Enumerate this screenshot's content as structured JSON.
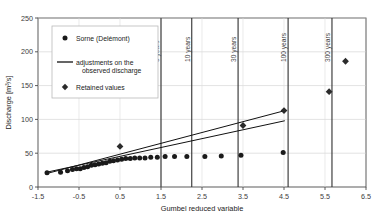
{
  "chart_data": {
    "type": "scatter",
    "title": "",
    "xlabel": "Gumbel reduced variable",
    "ylabel": "Discharge [m3/s]",
    "ylabel_display": "Discharge [m³/s]",
    "xlim": [
      -1.5,
      6.5
    ],
    "ylim": [
      0,
      250
    ],
    "xticks": [
      "-1.5",
      "-0.5",
      "0.5",
      "1.5",
      "2.5",
      "3.5",
      "4.5",
      "5.5",
      "6.5"
    ],
    "xtick_values": [
      -1.5,
      -0.5,
      0.5,
      1.5,
      2.5,
      3.5,
      4.5,
      5.5,
      6.5
    ],
    "yticks": [
      "0",
      "50",
      "100",
      "150",
      "200",
      "250"
    ],
    "ytick_values": [
      0,
      50,
      100,
      150,
      200,
      250
    ],
    "grid": true,
    "legend_position": "upper-left",
    "series": [
      {
        "name": "Sorne (Delemont)",
        "name_display": "Sorne (Delémont)",
        "type": "scatter",
        "marker": "circle",
        "color": "#1a1a1a",
        "points": [
          [
            -1.28,
            21
          ],
          [
            -0.95,
            22
          ],
          [
            -0.78,
            24
          ],
          [
            -0.66,
            26
          ],
          [
            -0.56,
            27
          ],
          [
            -0.47,
            27
          ],
          [
            -0.38,
            29
          ],
          [
            -0.29,
            30
          ],
          [
            -0.2,
            32
          ],
          [
            -0.11,
            33
          ],
          [
            -0.02,
            34
          ],
          [
            0.07,
            35
          ],
          [
            0.16,
            36
          ],
          [
            0.25,
            38
          ],
          [
            0.34,
            39
          ],
          [
            0.44,
            40
          ],
          [
            0.54,
            41
          ],
          [
            0.64,
            42
          ],
          [
            0.75,
            42
          ],
          [
            0.86,
            43
          ],
          [
            0.98,
            43
          ],
          [
            1.11,
            43
          ],
          [
            1.25,
            44
          ],
          [
            1.41,
            44
          ],
          [
            1.6,
            45
          ],
          [
            1.83,
            45
          ],
          [
            2.13,
            45
          ],
          [
            2.57,
            45
          ],
          [
            2.97,
            46
          ],
          [
            3.45,
            47
          ],
          [
            4.48,
            51
          ]
        ]
      },
      {
        "name": "adjustments on the observed discharge",
        "type": "line",
        "color": "#111111",
        "lines": [
          {
            "x": [
              -1.28,
              4.52
            ],
            "y": [
              20,
              113
            ]
          },
          {
            "x": [
              -1.28,
              4.52
            ],
            "y": [
              22,
              98
            ]
          }
        ]
      },
      {
        "name": "Retained values",
        "type": "scatter",
        "marker": "diamond",
        "color": "#2b2b2b",
        "points": [
          [
            0.5,
            60
          ],
          [
            3.5,
            91
          ],
          [
            4.5,
            113
          ],
          [
            5.6,
            141
          ],
          [
            6.0,
            186
          ]
        ]
      }
    ],
    "return_period_lines": [
      {
        "label": "5 years",
        "x": 1.5
      },
      {
        "label": "10 years",
        "x": 2.25
      },
      {
        "label": "30 years",
        "x": 3.38
      },
      {
        "label": "100 years",
        "x": 4.6
      },
      {
        "label": "300 years",
        "x": 5.67
      }
    ],
    "legend": {
      "entries": [
        {
          "marker": "circle",
          "label": "Sorne (Delémont)"
        },
        {
          "marker": "line",
          "label": "adjustments on the",
          "label2": "observed discharge"
        },
        {
          "marker": "diamond",
          "label": "Retained values"
        }
      ]
    }
  }
}
